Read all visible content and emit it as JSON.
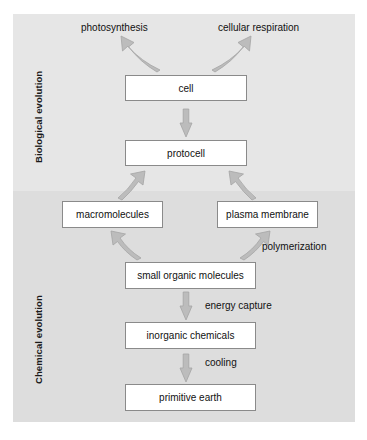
{
  "figure": {
    "type": "flow-diagram",
    "bands": [
      {
        "key": "biological",
        "label": "Biological evolution",
        "background": "#e6e6e6"
      },
      {
        "key": "chemical",
        "label": "Chemical evolution",
        "background": "#dddddd"
      }
    ],
    "colors": {
      "page_background": "#ffffff",
      "band_upper": "#e6e6e6",
      "band_lower": "#dddddd",
      "box_fill": "#ffffff",
      "box_border": "#8a8a8a",
      "arrow_fill": "#b9b9b9",
      "arrow_stroke": "#9a9a9a",
      "text": "#111111"
    }
  },
  "nodes": {
    "cell": "cell",
    "protocell": "protocell",
    "macromolecules": "macromolecules",
    "plasma_membrane": "plasma membrane",
    "small_organic_molecules": "small organic molecules",
    "inorganic_chemicals": "inorganic chemicals",
    "primitive_earth": "primitive earth"
  },
  "outputs": {
    "photosynthesis": "photosynthesis",
    "cellular_respiration": "cellular respiration"
  },
  "edge_labels": {
    "polymerization": "polymerization",
    "energy_capture": "energy capture",
    "cooling": "cooling"
  },
  "edges": [
    {
      "from": "primitive_earth",
      "to": "inorganic_chemicals",
      "label": "cooling",
      "style": "straight"
    },
    {
      "from": "inorganic_chemicals",
      "to": "small_organic_molecules",
      "label": "energy capture",
      "style": "straight"
    },
    {
      "from": "small_organic_molecules",
      "to": "macromolecules",
      "label": "",
      "style": "curved"
    },
    {
      "from": "small_organic_molecules",
      "to": "plasma_membrane",
      "label": "polymerization",
      "style": "curved"
    },
    {
      "from": "macromolecules",
      "to": "protocell",
      "label": "",
      "style": "curved"
    },
    {
      "from": "plasma_membrane",
      "to": "protocell",
      "label": "",
      "style": "curved"
    },
    {
      "from": "protocell",
      "to": "cell",
      "label": "",
      "style": "straight"
    },
    {
      "from": "cell",
      "to": "photosynthesis",
      "label": "",
      "style": "curved"
    },
    {
      "from": "cell",
      "to": "cellular_respiration",
      "label": "",
      "style": "curved"
    }
  ]
}
